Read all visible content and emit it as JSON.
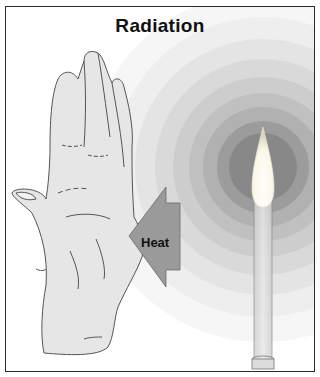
{
  "diagram": {
    "title": "Radiation",
    "arrow_label": "Heat",
    "elements": [
      {
        "name": "hand",
        "description": "open hand held up, palm facing flame"
      },
      {
        "name": "heat-arrow",
        "description": "gray arrow pointing left from flame toward hand"
      },
      {
        "name": "candle",
        "description": "tall candle with bright flame"
      },
      {
        "name": "radiation-rings",
        "description": "concentric gray rings radiating from flame, darker near center"
      }
    ],
    "colors": {
      "frame": "#2a2a2a",
      "hand_fill": "#e6e6e6",
      "hand_outline": "#555555",
      "arrow_fill": "#9a9a9a",
      "flame": "#fdfbf0",
      "rings": [
        "#f4f4f4",
        "#eaeaea",
        "#dfdfdf",
        "#d3d3d3",
        "#c6c6c6",
        "#b8b8b8",
        "#a9a9a9",
        "#8f8f8f"
      ]
    }
  }
}
